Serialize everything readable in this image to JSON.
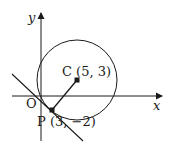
{
  "diagram": {
    "axes": {
      "x_label": "x",
      "y_label": "y",
      "origin_label": "O"
    },
    "points": {
      "C": {
        "name": "C",
        "coords": [
          5,
          3
        ],
        "label": "C (5, 3)"
      },
      "P": {
        "name": "P",
        "coords": [
          3,
          -2
        ],
        "label": "P (3, −2)"
      }
    },
    "elements": [
      "circle centred at C",
      "radius segment CP",
      "tangent line at P"
    ],
    "colors": {
      "stroke": "#1a1a1a",
      "background": "#ffffff"
    }
  }
}
